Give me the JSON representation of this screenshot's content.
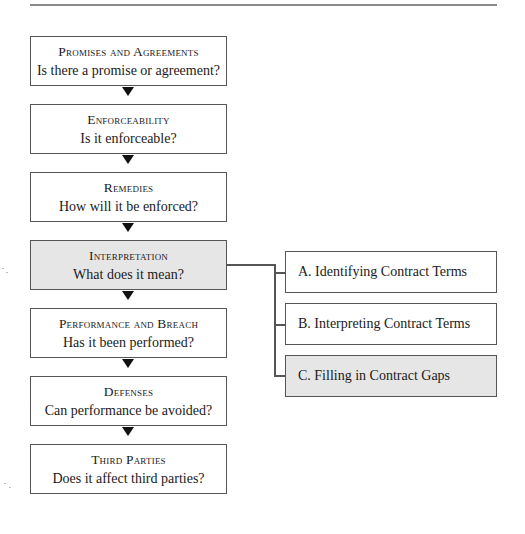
{
  "diagram": {
    "steps": [
      {
        "title": "Promises and Agreements",
        "question": "Is there a promise or agreement?",
        "highlighted": false
      },
      {
        "title": "Enforceability",
        "question": "Is it enforceable?",
        "highlighted": false
      },
      {
        "title": "Remedies",
        "question": "How will it be enforced?",
        "highlighted": false
      },
      {
        "title": "Interpretation",
        "question": "What does it mean?",
        "highlighted": true
      },
      {
        "title": "Performance and Breach",
        "question": "Has it been performed?",
        "highlighted": false
      },
      {
        "title": "Defenses",
        "question": "Can performance be avoided?",
        "highlighted": false
      },
      {
        "title": "Third Parties",
        "question": "Does it affect third parties?",
        "highlighted": false
      }
    ],
    "subtopics": [
      {
        "label": "A.  Identifying Contract Terms",
        "highlighted": false
      },
      {
        "label": "B.  Interpreting Contract Terms",
        "highlighted": false
      },
      {
        "label": "C.  Filling in Contract Gaps",
        "highlighted": true
      }
    ],
    "colors": {
      "highlight_fill": "#e6e6e6",
      "border": "#555555",
      "arrow": "#111111"
    }
  }
}
